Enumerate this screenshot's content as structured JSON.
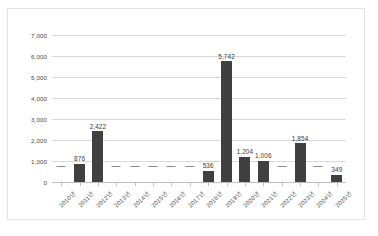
{
  "chart_data": {
    "type": "bar",
    "title": "",
    "subtitle": "",
    "xlabel": "",
    "ylabel": "",
    "ylim": [
      0,
      7000
    ],
    "ytick_step": 1000,
    "ytick_labels": [
      "7,000",
      "6,000",
      "5,000",
      "4,000",
      "3,000",
      "2,000",
      "1,000",
      "0"
    ],
    "ytick_values": [
      7000,
      6000,
      5000,
      4000,
      3000,
      2000,
      1000,
      0
    ],
    "grid": true,
    "legend": null,
    "legend_position": "none",
    "bar_color": "#404040",
    "gridline_color": "#d9d9d9",
    "axis_color": "#bfbfbf",
    "zero_marker": "dash",
    "categories": [
      "2010년",
      "2011년",
      "2012년",
      "2013년",
      "2014년",
      "2015년",
      "2016년",
      "2017년",
      "2018년",
      "2019년",
      "2020년",
      "2021년",
      "2022년",
      "2023년",
      "2024년",
      "2025년"
    ],
    "values": [
      0,
      876,
      2422,
      0,
      0,
      0,
      0,
      0,
      536,
      5742,
      1204,
      1006,
      0,
      1854,
      0,
      349
    ],
    "value_labels": [
      "",
      "876",
      "2,422",
      "",
      "",
      "",
      "",
      "",
      "536",
      "5,742",
      "1,204",
      "1,006",
      "",
      "1,854",
      "",
      "349"
    ]
  }
}
